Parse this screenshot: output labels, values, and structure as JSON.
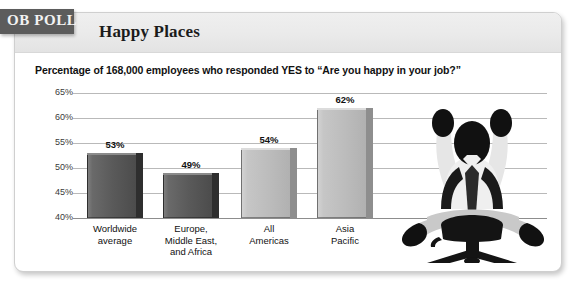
{
  "badge": {
    "label": "OB POLL"
  },
  "header": {
    "title": "Happy Places"
  },
  "chart_data": {
    "type": "bar",
    "title": "Happy Places",
    "subtitle": "Percentage of 168,000 employees who responded YES to “Are you happy in your job?”",
    "xlabel": "",
    "ylabel": "",
    "ylim": [
      40,
      65
    ],
    "ytick_labels": [
      "65%",
      "60%",
      "55%",
      "50%",
      "45%",
      "40%"
    ],
    "yticks": [
      65,
      60,
      55,
      50,
      45,
      40
    ],
    "grid": true,
    "legend": null,
    "categories": [
      "Worldwide\naverage",
      "Europe,\nMiddle East,\nand Africa",
      "All\nAmericas",
      "Asia\nPacific"
    ],
    "category_lines": [
      [
        "Worldwide",
        "average"
      ],
      [
        "Europe,",
        "Middle East,",
        "and Africa"
      ],
      [
        "All",
        "Americas"
      ],
      [
        "Asia",
        "Pacific"
      ]
    ],
    "values": [
      53,
      49,
      54,
      62
    ],
    "value_labels": [
      "53%",
      "49%",
      "54%",
      "62%"
    ],
    "bar_shades": [
      "dark",
      "dark",
      "light",
      "light"
    ],
    "colors": {
      "bar_dark": "#5a5a5a",
      "bar_dark_edge": "#2e2e2e",
      "bar_light": "#bcbcbc",
      "bar_light_edge": "#8e8e8e",
      "gridline": "#b9b9b9",
      "axis": "#8d8d8d",
      "badge_bg": "#5c5c5c",
      "header_bg": "#eaeaea",
      "text": "#111111"
    }
  },
  "illustration": {
    "name": "celebrating-office-worker-silhouette"
  }
}
